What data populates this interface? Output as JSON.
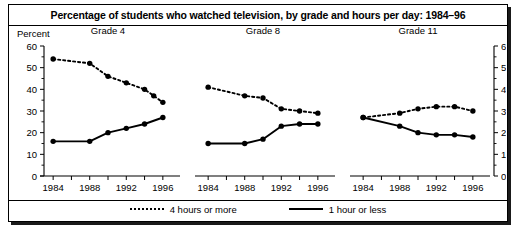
{
  "figure": {
    "title": "Percentage of students who watched television, by grade and hours per day: 1984–96",
    "y_axis_label": "Percent"
  },
  "legend": {
    "position": "bottom",
    "entries": [
      {
        "label": "4 hours or more",
        "style": "dotted",
        "icon": "dotted-line-icon"
      },
      {
        "label": "1 hour or less",
        "style": "solid",
        "icon": "solid-line-icon"
      }
    ]
  },
  "chart_data": {
    "type": "line",
    "title": "Percentage of students who watched television, by grade and hours per day: 1984–96",
    "xlabel": "",
    "ylabel": "Percent",
    "ylim": [
      0,
      60
    ],
    "yticks": [
      0,
      10,
      20,
      30,
      40,
      50,
      60
    ],
    "ytick_labels": [
      "0",
      "10",
      "20",
      "30",
      "40",
      "50",
      "60"
    ],
    "xlim": [
      1983,
      1997
    ],
    "xticks": [
      1984,
      1986,
      1988,
      1990,
      1992,
      1994,
      1996
    ],
    "xtick_labels": [
      "1984",
      "",
      "1988",
      "",
      "1992",
      "",
      "1996"
    ],
    "xtick_labels_shown": [
      "1984",
      "1988",
      "1992",
      "1996"
    ],
    "grid": false,
    "dual_y_axis": true,
    "panels": [
      {
        "name": "Grade 4",
        "series": [
          {
            "name": "4 hours or more",
            "style": "dotted",
            "x": [
              1984,
              1988,
              1990,
              1992,
              1994,
              1995,
              1996
            ],
            "values": [
              54,
              52,
              46,
              43,
              40,
              37,
              34
            ]
          },
          {
            "name": "1 hour or less",
            "style": "solid",
            "x": [
              1984,
              1988,
              1990,
              1992,
              1994,
              1996
            ],
            "values": [
              16,
              16,
              20,
              22,
              24,
              27
            ]
          }
        ]
      },
      {
        "name": "Grade 8",
        "series": [
          {
            "name": "4 hours or more",
            "style": "dotted",
            "x": [
              1984,
              1988,
              1990,
              1992,
              1994,
              1996
            ],
            "values": [
              41,
              37,
              36,
              31,
              30,
              29
            ]
          },
          {
            "name": "1 hour or less",
            "style": "solid",
            "x": [
              1984,
              1988,
              1990,
              1992,
              1994,
              1996
            ],
            "values": [
              15,
              15,
              17,
              23,
              24,
              24
            ]
          }
        ]
      },
      {
        "name": "Grade 11",
        "series": [
          {
            "name": "4 hours or more",
            "style": "dotted",
            "x": [
              1984,
              1988,
              1990,
              1992,
              1994,
              1996
            ],
            "values": [
              27,
              29,
              31,
              32,
              32,
              30
            ]
          },
          {
            "name": "1 hour or less",
            "style": "solid",
            "x": [
              1984,
              1988,
              1990,
              1992,
              1994,
              1996
            ],
            "values": [
              27,
              23,
              20,
              19,
              19,
              18
            ]
          }
        ]
      }
    ]
  },
  "colors": {
    "ink": "#000000",
    "background": "#ffffff"
  }
}
